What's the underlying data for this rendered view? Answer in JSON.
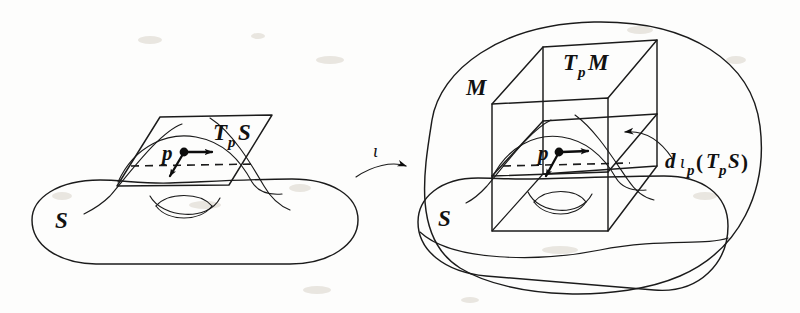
{
  "figure": {
    "name": "tangent-space-immersion-diagram",
    "style": "hand-drawn black ink line art on white paper",
    "ink_color": "#1b1b1b",
    "paper_color": "#fdfdfc"
  },
  "left_panel": {
    "name": "source-surface-panel",
    "surface_label": "S",
    "tangent_plane_label": {
      "base": "T",
      "subscript": "p",
      "space": "S"
    },
    "point_label": "p",
    "vectors": [
      {
        "name": "tangent-vector-horizontal",
        "direction": "right"
      },
      {
        "name": "tangent-vector-diagonal",
        "direction": "down-left"
      }
    ]
  },
  "map": {
    "name": "immersion-arrow",
    "symbol": "ι",
    "direction": "left-to-right"
  },
  "right_panel": {
    "name": "target-manifold-panel",
    "manifold_label": "M",
    "surface_label": "S",
    "tangent_space_label": {
      "base": "T",
      "subscript": "p",
      "space": "M"
    },
    "point_label": "p",
    "differential_label": {
      "d": "d",
      "iota": "ι",
      "subscript": "p",
      "open_paren": "(",
      "base": "T",
      "arg_subscript": "p",
      "arg": "S",
      "close_paren": ")"
    },
    "vectors": [
      {
        "name": "tangent-vector-horizontal",
        "direction": "right"
      },
      {
        "name": "tangent-vector-diagonal",
        "direction": "down-left"
      }
    ]
  }
}
